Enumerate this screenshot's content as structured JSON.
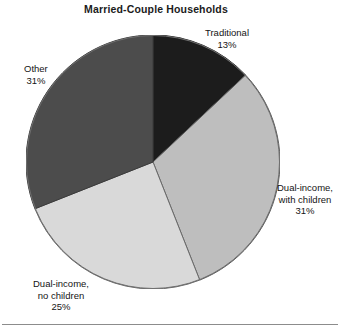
{
  "figure": {
    "title": "Married-Couple Households",
    "background": "#ffffff",
    "rule_color": "#8c8c8c"
  },
  "labels": {
    "traditional": {
      "name": "Traditional",
      "value": "13%"
    },
    "other": {
      "name": "Other",
      "value": "31%"
    },
    "dual_with_children": {
      "name_line1": "Dual-income,",
      "name_line2": "with children",
      "value": "31%"
    },
    "dual_no_children": {
      "name_line1": "Dual-income,",
      "name_line2": "no children",
      "value": "25%"
    }
  },
  "chart_data": {
    "type": "pie",
    "title": "Married-Couple Households",
    "xlabel": "",
    "ylabel": "",
    "start_angle_deg": 0,
    "direction": "clockwise",
    "legend_position": "none (direct labels)",
    "grid": false,
    "units": "percent",
    "total": 100,
    "categories": [
      "Traditional",
      "Dual-income, with children",
      "Dual-income, no children",
      "Other"
    ],
    "values": [
      13,
      31,
      25,
      31
    ],
    "value_labels": [
      "13%",
      "31%",
      "25%",
      "31%"
    ],
    "colors": [
      "#1c1c1c",
      "#bebebe",
      "#d9d9d9",
      "#4c4c4c"
    ],
    "slices": [
      {
        "label": "Traditional",
        "value": 13,
        "value_label": "13%",
        "color": "#1c1c1c",
        "start_deg": 0,
        "end_deg": 46.8,
        "label_position": "top-right"
      },
      {
        "label": "Dual-income, with children",
        "value": 31,
        "value_label": "31%",
        "color": "#bebebe",
        "start_deg": 46.8,
        "end_deg": 158.4,
        "label_position": "right"
      },
      {
        "label": "Dual-income, no children",
        "value": 25,
        "value_label": "25%",
        "color": "#d9d9d9",
        "start_deg": 158.4,
        "end_deg": 248.4,
        "label_position": "bottom-left"
      },
      {
        "label": "Other",
        "value": 31,
        "value_label": "31%",
        "color": "#4c4c4c",
        "start_deg": 248.4,
        "end_deg": 360,
        "label_position": "left"
      }
    ]
  }
}
